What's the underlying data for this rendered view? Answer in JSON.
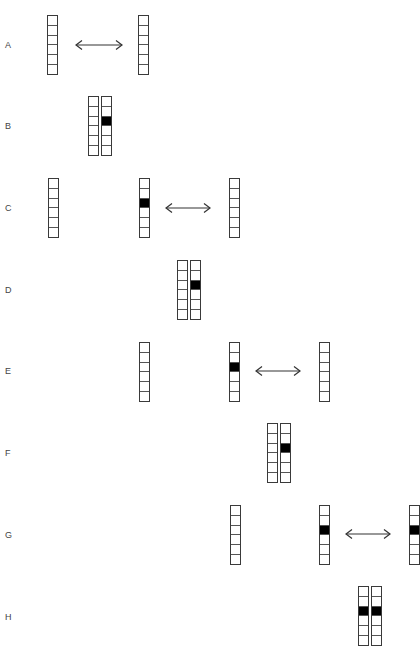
{
  "diagram": {
    "cells_per_strip": 6,
    "colors": {
      "filled": "#000000",
      "empty": "#ffffff",
      "outline": "#3a3a3a"
    },
    "rows": [
      {
        "label": "A",
        "label_y": 40,
        "strip_top": 15,
        "strips": [
          {
            "x": 47,
            "filled": []
          },
          {
            "x": 138,
            "filled": []
          }
        ],
        "arrow": {
          "x1": 75,
          "x2": 123,
          "y": 45
        }
      },
      {
        "label": "B",
        "label_y": 121,
        "strip_top": 96,
        "strips": [
          {
            "x": 88,
            "filled": []
          },
          {
            "x": 101,
            "filled": [
              2
            ]
          }
        ]
      },
      {
        "label": "C",
        "label_y": 203,
        "strip_top": 178,
        "strips": [
          {
            "x": 48,
            "filled": []
          },
          {
            "x": 139,
            "filled": [
              2
            ]
          },
          {
            "x": 229,
            "filled": []
          }
        ],
        "arrow": {
          "x1": 165,
          "x2": 211,
          "y": 208
        }
      },
      {
        "label": "D",
        "label_y": 285,
        "strip_top": 260,
        "strips": [
          {
            "x": 177,
            "filled": []
          },
          {
            "x": 190,
            "filled": [
              2
            ]
          }
        ]
      },
      {
        "label": "E",
        "label_y": 366,
        "strip_top": 342,
        "strips": [
          {
            "x": 139,
            "filled": []
          },
          {
            "x": 229,
            "filled": [
              2
            ]
          },
          {
            "x": 319,
            "filled": []
          }
        ],
        "arrow": {
          "x1": 255,
          "x2": 301,
          "y": 371
        }
      },
      {
        "label": "F",
        "label_y": 448,
        "strip_top": 423,
        "strips": [
          {
            "x": 267,
            "filled": []
          },
          {
            "x": 280,
            "filled": [
              2
            ]
          }
        ]
      },
      {
        "label": "G",
        "label_y": 530,
        "strip_top": 505,
        "strips": [
          {
            "x": 230,
            "filled": []
          },
          {
            "x": 319,
            "filled": [
              2
            ]
          },
          {
            "x": 409,
            "filled": [
              2
            ]
          }
        ],
        "arrow": {
          "x1": 345,
          "x2": 391,
          "y": 534
        }
      },
      {
        "label": "H",
        "label_y": 612,
        "strip_top": 586,
        "strips": [
          {
            "x": 358,
            "filled": [
              2
            ]
          },
          {
            "x": 371,
            "filled": [
              2
            ]
          }
        ]
      }
    ]
  }
}
